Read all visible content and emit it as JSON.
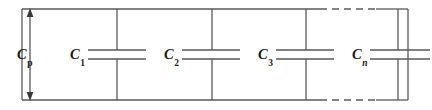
{
  "figure": {
    "type": "circuit-diagram",
    "background_color": "#ffffff",
    "line_color": "#595959",
    "text_color": "#1a1a1a"
  },
  "frame": {
    "left": 22,
    "right": 408,
    "top": 9,
    "bottom": 100
  },
  "measure": {
    "name": "parallel-capacitance-measure",
    "symbol": "C",
    "subscript": "p",
    "subscript_style": "upright",
    "arrow": "double-headed-vertical",
    "x": 30,
    "y_top": 9,
    "y_bottom": 100
  },
  "capacitors": [
    {
      "id": "c1",
      "symbol": "C",
      "subscript": "1",
      "subscript_style": "upright",
      "label_x": 70,
      "branch_x": 117,
      "plate_left": 88,
      "plate_right": 146
    },
    {
      "id": "c2",
      "symbol": "C",
      "subscript": "2",
      "subscript_style": "upright",
      "label_x": 164,
      "branch_x": 212,
      "plate_left": 182,
      "plate_right": 240
    },
    {
      "id": "c3",
      "symbol": "C",
      "subscript": "3",
      "subscript_style": "upright",
      "label_x": 258,
      "branch_x": 306,
      "plate_left": 276,
      "plate_right": 334
    },
    {
      "id": "cn",
      "symbol": "C",
      "subscript": "n",
      "subscript_style": "italic",
      "label_x": 352,
      "branch_x": 398,
      "plate_left": 370,
      "plate_right": 428
    }
  ],
  "plates": {
    "upper_y": 50,
    "lower_y": 59
  },
  "dashed_segments": [
    {
      "name": "top-continuation",
      "y": 9,
      "x_start": 320,
      "x_end": 376
    },
    {
      "name": "bottom-continuation",
      "y": 100,
      "x_start": 320,
      "x_end": 376
    }
  ]
}
